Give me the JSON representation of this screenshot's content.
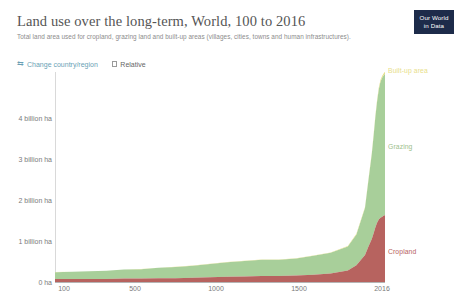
{
  "header": {
    "title": "Land use over the long-term, World, 100 to 2016",
    "subtitle": "Total land area used for cropland, grazing land and built-up areas (villages, cities, towns and human infrastructures)."
  },
  "logo": {
    "line1": "Our World",
    "line2": "in Data",
    "background": "#1d2b4a",
    "text_color": "#ffffff"
  },
  "controls": {
    "change_region": {
      "label": "Change country/region",
      "icon": "swap-horizontal-icon",
      "color": "#6a9fb5"
    },
    "relative": {
      "label": "Relative",
      "icon": "checkbox-icon",
      "checked": false,
      "color": "#666666"
    }
  },
  "colors": {
    "cropland": "#b7635f",
    "grazing": "#a8cf9a",
    "built_up": "#e8e08a",
    "axis": "#b5b5b5",
    "tick_text": "#7a7a7a",
    "title_text": "#555555",
    "subtitle_text": "#8c8c8c"
  },
  "chart_data": {
    "type": "area",
    "stacked": true,
    "title": "Land use over the long-term, World, 100 to 2016",
    "subtitle": "Total land area used for cropland, grazing land and built-up areas (villages, cities, towns and human infrastructures).",
    "xlabel": "",
    "ylabel": "",
    "xlim": [
      100,
      2016
    ],
    "ylim": [
      0,
      4900000000
    ],
    "grid": false,
    "legend": "inline-right",
    "y_unit": "ha",
    "yticks": [
      0,
      1000000000,
      2000000000,
      3000000000,
      4000000000
    ],
    "ytick_labels": [
      "0 ha",
      "1 billion ha",
      "2 billion ha",
      "3 billion ha",
      "4 billion ha"
    ],
    "xticks": [
      100,
      500,
      1000,
      1500,
      2016
    ],
    "xtick_labels": [
      "100",
      "500",
      "1000",
      "1500",
      "2016"
    ],
    "x": [
      100,
      200,
      300,
      400,
      500,
      600,
      700,
      800,
      900,
      1000,
      1100,
      1200,
      1300,
      1400,
      1500,
      1600,
      1700,
      1800,
      1850,
      1900,
      1920,
      1940,
      1950,
      1960,
      1970,
      1980,
      1990,
      2000,
      2010,
      2016
    ],
    "series": [
      {
        "name": "Cropland",
        "label": "Cropland",
        "color": "#b7635f",
        "unit": "billion ha",
        "values": [
          0.07,
          0.07,
          0.07,
          0.07,
          0.08,
          0.08,
          0.09,
          0.09,
          0.1,
          0.11,
          0.12,
          0.13,
          0.14,
          0.14,
          0.15,
          0.17,
          0.2,
          0.27,
          0.39,
          0.63,
          0.83,
          1.01,
          1.14,
          1.27,
          1.38,
          1.46,
          1.5,
          1.52,
          1.55,
          1.56
        ]
      },
      {
        "name": "Grazing",
        "label": "Grazing",
        "color": "#a8cf9a",
        "unit": "billion ha",
        "values": [
          0.16,
          0.17,
          0.18,
          0.19,
          0.21,
          0.22,
          0.24,
          0.26,
          0.28,
          0.31,
          0.34,
          0.36,
          0.38,
          0.38,
          0.4,
          0.44,
          0.48,
          0.56,
          0.72,
          1.1,
          1.55,
          2.0,
          2.28,
          2.58,
          2.83,
          3.04,
          3.18,
          3.25,
          3.28,
          3.3
        ]
      },
      {
        "name": "Built-up area",
        "label": "Built-up area",
        "color": "#e8e08a",
        "unit": "billion ha",
        "values": [
          0.002,
          0.002,
          0.002,
          0.002,
          0.003,
          0.003,
          0.003,
          0.004,
          0.004,
          0.005,
          0.005,
          0.006,
          0.006,
          0.006,
          0.007,
          0.008,
          0.009,
          0.011,
          0.014,
          0.018,
          0.022,
          0.026,
          0.029,
          0.032,
          0.035,
          0.038,
          0.041,
          0.043,
          0.045,
          0.046
        ]
      }
    ]
  }
}
